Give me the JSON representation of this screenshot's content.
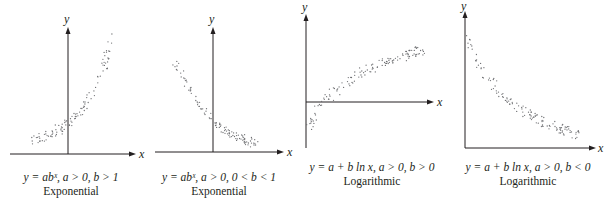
{
  "chart_data": [
    {
      "type": "scatter",
      "title": "Exponential",
      "equation": "y = abˣ, a > 0, b > 1",
      "xlabel": "x",
      "ylabel": "y",
      "grid": false,
      "trend": "increasing, convex (exponential growth)",
      "axes": {
        "yaxis_x": 68,
        "yaxis_top": 28,
        "yaxis_bottom": 154,
        "xaxis_y": 154,
        "xaxis_left": 10,
        "xaxis_right": 136
      },
      "band": {
        "start": [
          34,
          140
        ],
        "end": [
          113,
          36
        ],
        "curve": "exp",
        "width": 9,
        "count": 110
      }
    },
    {
      "type": "scatter",
      "title": "Exponential",
      "equation": "y = abˣ, a > 0, 0 < b < 1",
      "xlabel": "x",
      "ylabel": "y",
      "grid": false,
      "trend": "decreasing, convex (exponential decay)",
      "axes": {
        "yaxis_x": 213,
        "yaxis_top": 28,
        "yaxis_bottom": 152,
        "xaxis_y": 152,
        "xaxis_left": 155,
        "xaxis_right": 284
      },
      "band": {
        "start": [
          174,
          58
        ],
        "end": [
          258,
          144
        ],
        "curve": "decay",
        "width": 9,
        "count": 110
      }
    },
    {
      "type": "scatter",
      "title": "Logarithmic",
      "equation": "y = a + b ln x, a > 0, b > 0",
      "xlabel": "x",
      "ylabel": "y",
      "grid": false,
      "trend": "increasing, concave (logarithmic growth)",
      "axes": {
        "yaxis_x": 306,
        "yaxis_top": 15,
        "yaxis_bottom": 148,
        "xaxis_y": 102,
        "xaxis_left": 306,
        "xaxis_right": 434
      },
      "band": {
        "start": [
          309,
          128
        ],
        "end": [
          424,
          50
        ],
        "curve": "log",
        "width": 10,
        "count": 130
      }
    },
    {
      "type": "scatter",
      "title": "Logarithmic",
      "equation": "y = a + b ln x, a > 0, b < 0",
      "xlabel": "x",
      "ylabel": "y",
      "grid": false,
      "trend": "decreasing, convex (logarithmic decline)",
      "axes": {
        "yaxis_x": 465,
        "yaxis_top": 12,
        "yaxis_bottom": 148,
        "xaxis_y": 148,
        "xaxis_left": 465,
        "xaxis_right": 596
      },
      "band": {
        "start": [
          467,
          36
        ],
        "end": [
          580,
          136
        ],
        "curve": "neglog",
        "width": 10,
        "count": 130
      }
    }
  ],
  "captions": [
    {
      "equation_parts": [
        "y",
        " = ",
        "ab",
        "x",
        ", ",
        "a",
        " > 0, ",
        "b",
        " > 1"
      ],
      "equation": "y = abˣ, a > 0, b > 1",
      "name": "Exponential"
    },
    {
      "equation": "y = abˣ, a > 0, 0 < b < 1",
      "name": "Exponential"
    },
    {
      "equation": "y = a + b ln x, a > 0, b > 0",
      "name": "Logarithmic"
    },
    {
      "equation": "y = a + b ln x, a > 0, b < 0",
      "name": "Logarithmic"
    }
  ],
  "axis_labels": {
    "x": "x",
    "y": "y"
  }
}
